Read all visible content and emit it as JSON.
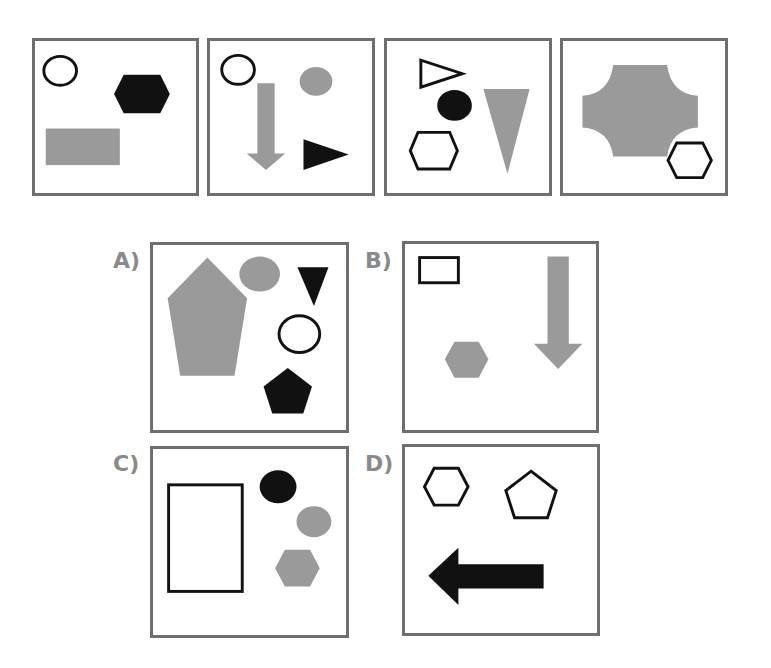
{
  "puzzle": {
    "sequence": [
      {
        "id": "p1",
        "shapes": [
          "outline-circle",
          "black-hexagon",
          "gray-rectangle"
        ]
      },
      {
        "id": "p2",
        "shapes": [
          "outline-circle",
          "gray-down-arrow",
          "gray-circle",
          "black-right-triangle"
        ]
      },
      {
        "id": "p3",
        "shapes": [
          "outline-right-triangle",
          "black-circle",
          "gray-down-triangle",
          "outline-hexagon"
        ]
      },
      {
        "id": "p4",
        "shapes": [
          "gray-notched-square",
          "outline-hexagon"
        ]
      }
    ],
    "options": [
      {
        "label": "A)",
        "shapes": [
          "gray-pentagon",
          "gray-circle",
          "black-down-triangle",
          "outline-circle",
          "black-pentagon"
        ]
      },
      {
        "label": "B)",
        "shapes": [
          "outline-rectangle",
          "gray-down-arrow",
          "gray-hexagon"
        ]
      },
      {
        "label": "C)",
        "shapes": [
          "outline-rectangle",
          "black-circle",
          "gray-circle",
          "gray-hexagon"
        ]
      },
      {
        "label": "D)",
        "shapes": [
          "outline-hexagon",
          "outline-pentagon",
          "black-left-arrow"
        ]
      }
    ]
  },
  "colors": {
    "black": "#111111",
    "gray": "#9a9a9a",
    "border": "#6e6e6e",
    "label": "#8a8a8a"
  }
}
